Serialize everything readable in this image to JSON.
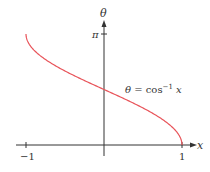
{
  "chart_data": {
    "type": "line",
    "title": "",
    "xlabel": "x",
    "ylabel": "θ",
    "xlim": [
      -1,
      1
    ],
    "ylim": [
      0,
      3.14159
    ],
    "x_ticks": [
      {
        "value": -1,
        "label": "−1"
      },
      {
        "value": 1,
        "label": "1"
      }
    ],
    "y_ticks": [
      {
        "value": 3.14159,
        "label": "π"
      }
    ],
    "grid": false,
    "legend": null,
    "annotations": [
      {
        "text": "θ = cos⁻¹ x",
        "x": 0.3,
        "y": 2.0
      }
    ],
    "series": [
      {
        "name": "θ = cos⁻¹ x",
        "color": "#e8545a",
        "x": [
          -1,
          -0.9,
          -0.75,
          -0.5,
          -0.25,
          0,
          0.25,
          0.5,
          0.75,
          0.9,
          1
        ],
        "values": [
          3.1416,
          2.6906,
          2.4189,
          2.0944,
          1.8235,
          1.5708,
          1.3181,
          1.0472,
          0.7227,
          0.451,
          0
        ]
      }
    ]
  },
  "labels": {
    "y_axis": "θ",
    "x_axis": "x",
    "pi_tick": "π",
    "x_neg_one": "−1",
    "x_one": "1",
    "curve_eq_lhs": "θ = cos",
    "curve_eq_exp": "−1",
    "curve_eq_rhs": " x"
  },
  "colors": {
    "curve": "#e8545a",
    "axis": "#333333"
  }
}
